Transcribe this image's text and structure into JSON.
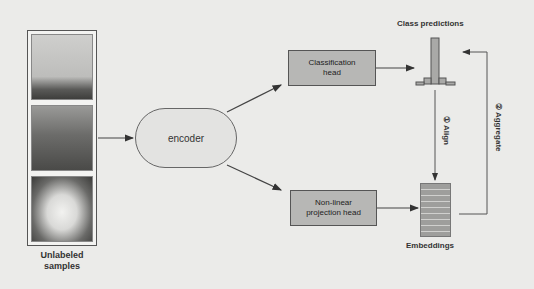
{
  "diagram": {
    "input": {
      "caption": "Unlabeled samples",
      "caption_line1": "Unlabeled",
      "caption_line2": "samples",
      "images": [
        {
          "subject": "jumping dog/horse"
        },
        {
          "subject": "cat"
        },
        {
          "subject": "white dog"
        }
      ]
    },
    "encoder": {
      "label": "encoder"
    },
    "classification_head": {
      "label": "Classification head",
      "line1": "Classification",
      "line2": "head"
    },
    "projection_head": {
      "label": "Non-linear projection head",
      "line1": "Non-linear",
      "line2": "projection head"
    },
    "class_predictions": {
      "label": "Class predictions"
    },
    "embeddings": {
      "label": "Embeddings",
      "rows": 8
    },
    "steps": {
      "align": "① Align",
      "aggregate": "② Aggregate"
    },
    "colors": {
      "background": "#ebebe9",
      "box_fill": "#b7b7b5",
      "encoder_fill": "#e3e3e1",
      "stroke": "#555555"
    }
  }
}
